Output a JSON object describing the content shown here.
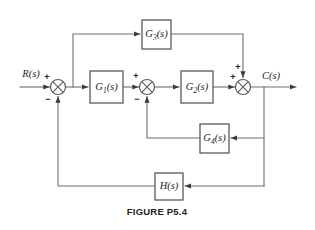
{
  "figure": {
    "caption": "FIGURE P5.4",
    "type": "control-system-block-diagram"
  },
  "signals": {
    "input_label": "R(s)",
    "output_label": "C(s)"
  },
  "blocks": [
    {
      "id": "G1",
      "label_main": "G",
      "label_sub": "1",
      "label_arg": "(s)",
      "full": "G1(s)",
      "x": 90,
      "y": 71,
      "w": 33,
      "h": 32
    },
    {
      "id": "G2",
      "label_main": "G",
      "label_sub": "2",
      "label_arg": "(s)",
      "full": "G2(s)",
      "x": 181,
      "y": 71,
      "w": 32,
      "h": 32
    },
    {
      "id": "G3",
      "label_main": "G",
      "label_sub": "3",
      "label_arg": "(s)",
      "full": "G3(s)",
      "x": 142,
      "y": 20,
      "w": 29,
      "h": 29
    },
    {
      "id": "G4",
      "label_main": "G",
      "label_sub": "4",
      "label_arg": "(s)",
      "full": "G4(s)",
      "x": 200,
      "y": 124,
      "w": 29,
      "h": 29
    },
    {
      "id": "H",
      "label_main": "H",
      "label_sub": "",
      "label_arg": "(s)",
      "full": "H(s)",
      "x": 155,
      "y": 173,
      "w": 28,
      "h": 27
    }
  ],
  "summing_junctions": [
    {
      "id": "sum1",
      "cx": 58,
      "cy": 87,
      "r": 7.5,
      "signs": [
        {
          "text": "+",
          "pos": "top-left"
        },
        {
          "text": "−",
          "pos": "bottom-left"
        }
      ]
    },
    {
      "id": "sum2",
      "cx": 147,
      "cy": 87,
      "r": 7.5,
      "signs": [
        {
          "text": "+",
          "pos": "top-left"
        },
        {
          "text": "−",
          "pos": "bottom-left"
        }
      ]
    },
    {
      "id": "sum3",
      "cx": 243,
      "cy": 87,
      "r": 7.5,
      "signs": [
        {
          "text": "+",
          "pos": "left"
        },
        {
          "text": "+",
          "pos": "top"
        }
      ]
    }
  ],
  "sign_glyphs": {
    "plus": "+",
    "minus": "−"
  },
  "colors": {
    "wire": "#6d6e71",
    "block_border": "#58595b",
    "text": "#231f20",
    "background": "#ffffff",
    "arrowhead": "#3b3b3d"
  }
}
